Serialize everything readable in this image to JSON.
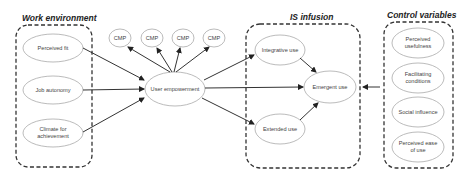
{
  "groups": {
    "work_environment": {
      "title": "Work environment"
    },
    "is_infusion": {
      "title": "IS infusion"
    },
    "control_variables": {
      "title": "Control variables"
    }
  },
  "nodes": {
    "perceived_fit": "Perceived fit",
    "job_autonomy": "Job autonomy",
    "climate_for_achievement": "Climate for achievement",
    "user_empowerment": "User empowerment",
    "cmp": [
      "CMP",
      "CMP",
      "CMP",
      "CMP"
    ],
    "integrative_use": "Integrative use",
    "extended_use": "Extended use",
    "emergent_use": "Emergent use",
    "perceived_usefulness": "Perceived usefulness",
    "facilitating_conditions": "Facilitating conditions",
    "social_influence": "Social influence",
    "perceived_ease_of_use": "Perceived ease of use"
  },
  "colors": {
    "stroke": "#333333",
    "ellipse_stroke": "#aaaaaa",
    "text": "#444444"
  }
}
